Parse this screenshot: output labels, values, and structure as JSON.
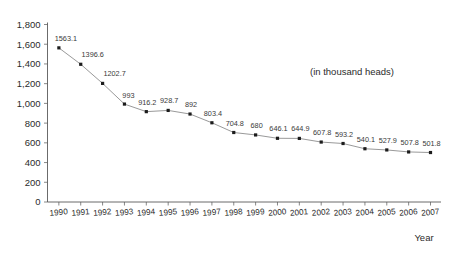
{
  "chart_data": {
    "type": "line",
    "title": "",
    "subtitle": "",
    "annotation": "(in thousand heads)",
    "xlabel": "Year",
    "ylabel": "",
    "categories": [
      "1990",
      "1991",
      "1992",
      "1993",
      "1994",
      "1995",
      "1996",
      "1997",
      "1998",
      "1999",
      "2000",
      "2001",
      "2002",
      "2003",
      "2004",
      "2005",
      "2006",
      "2007"
    ],
    "values": [
      1563.1,
      1396.6,
      1202.7,
      993,
      916.2,
      928.7,
      892,
      803.4,
      704.8,
      680,
      646.1,
      644.9,
      607.8,
      593.2,
      540.1,
      527.9,
      507.8,
      501.8
    ],
    "point_labels": [
      "1563.1",
      "1396.6",
      "1202.7",
      "993",
      "916.2",
      "928.7",
      "892",
      "803.4",
      "704.8",
      "680",
      "646.1",
      "644.9",
      "607.8",
      "593.2",
      "540.1",
      "527.9",
      "507.8",
      "501.8"
    ],
    "ylim": [
      0,
      1800
    ],
    "ytick_values": [
      0,
      200,
      400,
      600,
      800,
      1000,
      1200,
      1400,
      1600,
      1800
    ],
    "ytick_labels": [
      "0",
      "200",
      "400",
      "600",
      "800",
      "1,000",
      "1,200",
      "1,400",
      "1,600",
      "1,800"
    ],
    "grid": false,
    "legend": false,
    "legend_position": "none",
    "series": [
      {
        "name": "heads",
        "values": [
          1563.1,
          1396.6,
          1202.7,
          993,
          916.2,
          928.7,
          892,
          803.4,
          704.8,
          680,
          646.1,
          644.9,
          607.8,
          593.2,
          540.1,
          527.9,
          507.8,
          501.8
        ]
      }
    ],
    "colors": {
      "line": "#8d8d8d",
      "marker": "#1c1c1c",
      "axis": "#5a5a5a",
      "text": "#2b2b2b",
      "background": "#ffffff"
    }
  }
}
